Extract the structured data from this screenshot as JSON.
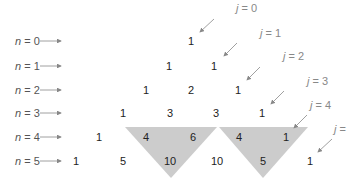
{
  "rows": [
    {
      "label_var": "n",
      "label_val": "= 0",
      "values": [
        "1"
      ]
    },
    {
      "label_var": "n",
      "label_val": "= 1",
      "values": [
        "1",
        "1"
      ]
    },
    {
      "label_var": "n",
      "label_val": "= 2",
      "values": [
        "1",
        "2",
        "1"
      ]
    },
    {
      "label_var": "n",
      "label_val": "= 3",
      "values": [
        "1",
        "3",
        "3",
        "1"
      ]
    },
    {
      "label_var": "n",
      "label_val": "= 4",
      "values": [
        "1",
        "4",
        "6",
        "4",
        "1"
      ]
    },
    {
      "label_var": "n",
      "label_val": "= 5",
      "values": [
        "1",
        "5",
        "10",
        "10",
        "5",
        "1"
      ]
    }
  ],
  "diagonals": [
    {
      "label_var": "j",
      "label_val": "= 0"
    },
    {
      "label_var": "j",
      "label_val": "= 1"
    },
    {
      "label_var": "j",
      "label_val": "= 2"
    },
    {
      "label_var": "j",
      "label_val": "= 3"
    },
    {
      "label_var": "j",
      "label_val": "= 4"
    },
    {
      "label_var": "j",
      "label_val": "="
    }
  ],
  "highlights": [
    {
      "description": "4 + 6 = 10",
      "fill": "#cccccc"
    },
    {
      "description": "4 + 1 = 5",
      "fill": "#cccccc"
    }
  ],
  "colors": {
    "numbers": "#222222",
    "row_labels": "#555555",
    "diag_labels": "#888888",
    "arrows": "#888888",
    "highlight": "#cccccc"
  }
}
